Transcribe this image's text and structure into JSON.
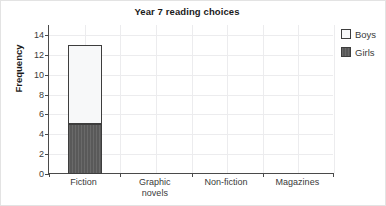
{
  "chart_data": {
    "type": "bar",
    "subtype": "stacked-vertical",
    "title": "Year 7 reading choices",
    "xlabel": "",
    "ylabel": "Frequency",
    "categories": [
      "Fiction",
      "Graphic\nnovels",
      "Non-fiction",
      "Magazines"
    ],
    "series": [
      {
        "name": "Girls",
        "values": [
          5,
          0,
          0,
          0
        ],
        "color": "#595959"
      },
      {
        "name": "Boys",
        "values": [
          8,
          0,
          0,
          0
        ],
        "color": "#f7f8f9"
      }
    ],
    "stack_totals": [
      13,
      0,
      0,
      0
    ],
    "ylim": [
      0,
      15
    ],
    "yticks": [
      0,
      2,
      4,
      6,
      8,
      10,
      12,
      14
    ],
    "ytick_labels": [
      "0",
      "2",
      "4",
      "6",
      "8",
      "10",
      "12",
      "14"
    ],
    "grid": true,
    "grid_axes": "both",
    "grid_color": "#ececee",
    "legend_position": "right",
    "legend": [
      {
        "label": "Boys",
        "swatch": "#f7f8f9"
      },
      {
        "label": "Girls",
        "swatch": "#595959"
      }
    ],
    "axis_color": "#4a4a4a",
    "bar_edge_color": "#3d3d3d"
  }
}
